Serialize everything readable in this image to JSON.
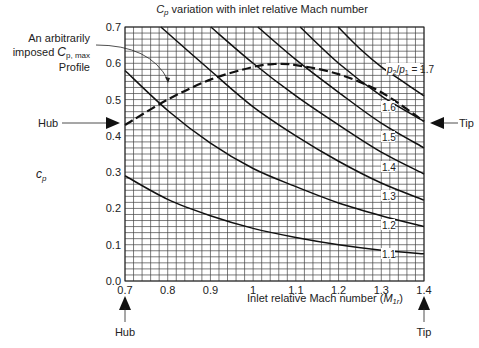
{
  "chart_data": {
    "type": "line",
    "title_parts": {
      "sym": "C",
      "sub": "p",
      "rest": " variation with inlet relative Mach number"
    },
    "xlabel": "Inlet relative Mach number (M1r)",
    "xlabel_parts": {
      "text": "Inlet relative Mach number (",
      "sym": "M",
      "sub": "1r",
      "close": ")"
    },
    "ylabel": "c_p",
    "ylabel_parts": {
      "sym": "c",
      "sub": "p"
    },
    "xlim": [
      0.7,
      1.4
    ],
    "ylim": [
      0.0,
      0.7
    ],
    "xticks": [
      "0.7",
      "0.8",
      "0.9",
      "1",
      "1.1",
      "1.2",
      "1.3",
      "1.4"
    ],
    "yticks": [
      "0.0",
      "0.1",
      "0.2",
      "0.3",
      "0.4",
      "0.5",
      "0.6",
      "0.7"
    ],
    "grid": true,
    "series": [
      {
        "name": "p2/p1 = 1.1",
        "label": "1.1",
        "points": [
          [
            0.7,
            0.29
          ],
          [
            0.8,
            0.225
          ],
          [
            0.9,
            0.18
          ],
          [
            1.0,
            0.145
          ],
          [
            1.1,
            0.12
          ],
          [
            1.2,
            0.1
          ],
          [
            1.3,
            0.085
          ],
          [
            1.4,
            0.075
          ]
        ]
      },
      {
        "name": "p2/p1 = 1.2",
        "label": "1.2",
        "points": [
          [
            0.7,
            0.58
          ],
          [
            0.8,
            0.47
          ],
          [
            0.9,
            0.38
          ],
          [
            1.0,
            0.31
          ],
          [
            1.1,
            0.26
          ],
          [
            1.2,
            0.215
          ],
          [
            1.3,
            0.18
          ],
          [
            1.4,
            0.15
          ]
        ]
      },
      {
        "name": "p2/p1 = 1.3",
        "label": "1.3",
        "points": [
          [
            0.784,
            0.7
          ],
          [
            0.9,
            0.58
          ],
          [
            1.0,
            0.48
          ],
          [
            1.1,
            0.4
          ],
          [
            1.2,
            0.33
          ],
          [
            1.3,
            0.27
          ],
          [
            1.4,
            0.223
          ]
        ]
      },
      {
        "name": "p2/p1 = 1.4",
        "label": "1.4",
        "points": [
          [
            0.901,
            0.7
          ],
          [
            1.0,
            0.6
          ],
          [
            1.1,
            0.51
          ],
          [
            1.2,
            0.43
          ],
          [
            1.3,
            0.355
          ],
          [
            1.4,
            0.295
          ]
        ]
      },
      {
        "name": "p2/p1 = 1.5",
        "label": "1.5",
        "points": [
          [
            1.011,
            0.7
          ],
          [
            1.1,
            0.61
          ],
          [
            1.2,
            0.52
          ],
          [
            1.3,
            0.435
          ],
          [
            1.4,
            0.367
          ]
        ]
      },
      {
        "name": "p2/p1 = 1.6",
        "label": "1.6",
        "points": [
          [
            1.11,
            0.7
          ],
          [
            1.2,
            0.6
          ],
          [
            1.3,
            0.51
          ],
          [
            1.4,
            0.44
          ]
        ]
      },
      {
        "name": "p2/p1 = 1.7",
        "label": "p2/p1 = 1.7",
        "points": [
          [
            1.199,
            0.7
          ],
          [
            1.25,
            0.64
          ],
          [
            1.3,
            0.59
          ],
          [
            1.35,
            0.55
          ],
          [
            1.4,
            0.51
          ]
        ]
      },
      {
        "name": "Imposed Cp,max profile",
        "style": "dashed",
        "points": [
          [
            0.7,
            0.43
          ],
          [
            0.8,
            0.5
          ],
          [
            0.9,
            0.555
          ],
          [
            1.0,
            0.59
          ],
          [
            1.05,
            0.598
          ],
          [
            1.1,
            0.595
          ],
          [
            1.2,
            0.57
          ],
          [
            1.3,
            0.52
          ],
          [
            1.4,
            0.44
          ]
        ]
      }
    ],
    "annotations": {
      "profile_label_lines": [
        "An arbitrarily",
        "imposed ",
        "Profile"
      ],
      "profile_sym": "C",
      "profile_sub": "p, max",
      "hub_label": "Hub",
      "tip_label": "Tip",
      "curve_labels": [
        "1.1",
        "1.2",
        "1.3",
        "1.4",
        "1.5",
        "1.6"
      ],
      "p_ratio_label": {
        "p2": "p",
        "sub2": "2",
        "slash": "/",
        "p1": "p",
        "sub1": "1",
        "eq": " = 1.7"
      }
    }
  }
}
